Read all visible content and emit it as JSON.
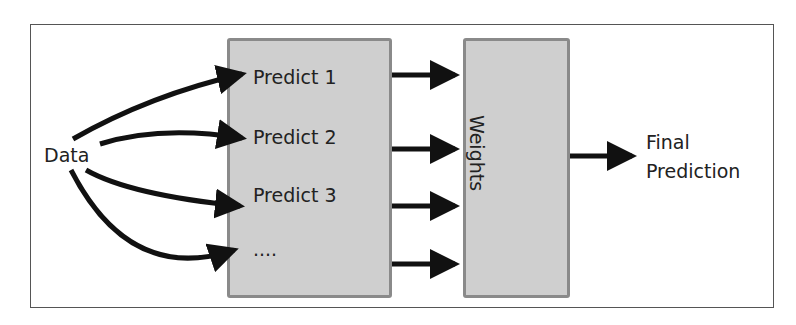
{
  "diagram": {
    "input_label": "Data",
    "predictors": [
      "Predict 1",
      "Predict 2",
      "Predict 3",
      "...."
    ],
    "combiner_label": "Weights",
    "output_label_line1": "Final",
    "output_label_line2": "Prediction",
    "colors": {
      "box_fill": "#cfcfcf",
      "box_border": "#8a8a8a",
      "arrow": "#111111",
      "frame": "#555555"
    }
  }
}
